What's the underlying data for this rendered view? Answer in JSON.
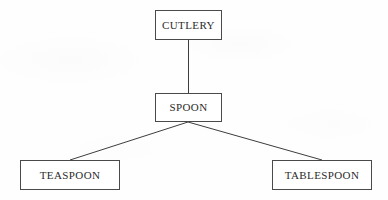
{
  "diagram": {
    "type": "hierarchy-tree",
    "canvas": {
      "width": 388,
      "height": 200
    },
    "style": {
      "background_color": "#fefefe",
      "border_color": "#4a4a4a",
      "text_color": "#2b2b2b",
      "edge_color": "#3d3d3d"
    },
    "nodes": [
      {
        "id": "cutlery",
        "label": "CUTLERY",
        "level": 0,
        "x": 155,
        "y": 10,
        "width": 67,
        "height": 30
      },
      {
        "id": "spoon",
        "label": "SPOON",
        "level": 1,
        "x": 155,
        "y": 93,
        "width": 67,
        "height": 29
      },
      {
        "id": "teaspoon",
        "label": "TEASPOON",
        "level": 2,
        "x": 20,
        "y": 160,
        "width": 100,
        "height": 30
      },
      {
        "id": "tablespoon",
        "label": "TABLESPOON",
        "level": 2,
        "x": 272,
        "y": 160,
        "width": 100,
        "height": 30
      }
    ],
    "edges": [
      {
        "id": "edge-cutlery-spoon",
        "from": "cutlery",
        "to": "spoon",
        "shape": "vertical",
        "x1": 188,
        "y1": 40,
        "x2": 188,
        "y2": 93
      },
      {
        "id": "edge-spoon-teaspoon",
        "from": "spoon",
        "to": "teaspoon",
        "shape": "diagonal",
        "x1": 188,
        "y1": 122,
        "x2": 70,
        "y2": 160
      },
      {
        "id": "edge-spoon-tablespoon",
        "from": "spoon",
        "to": "tablespoon",
        "shape": "diagonal",
        "x1": 188,
        "y1": 122,
        "x2": 322,
        "y2": 160
      }
    ]
  }
}
